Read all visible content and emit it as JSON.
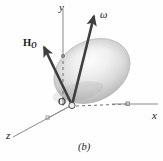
{
  "figure": {
    "caption": "(b)",
    "background_color": "#fefefe",
    "axes": [
      {
        "name": "y",
        "label": "y",
        "label_x": 59,
        "label_y": 2
      },
      {
        "name": "x",
        "label": "x",
        "label_x": 152,
        "label_y": 112
      },
      {
        "name": "z",
        "label": "z",
        "label_x": 6,
        "label_y": 131
      }
    ],
    "origin": {
      "label": "O",
      "label_x": 58,
      "label_y": 98,
      "point_x": 72,
      "point_y": 106
    },
    "vectors": [
      {
        "name": "angular-momentum-vector",
        "label": "H",
        "subscript": "O",
        "label_x": 23,
        "label_y": 38,
        "from_x": 72,
        "from_y": 105,
        "to_x": 44,
        "to_y": 47,
        "color": "#3f3f3f"
      },
      {
        "name": "angular-velocity-vector",
        "label": "ω",
        "label_x": 100,
        "label_y": 11,
        "from_x": 72,
        "from_y": 105,
        "to_x": 94,
        "to_y": 16,
        "color": "#3f3f3f"
      }
    ],
    "body": {
      "name": "rigid-body-ellipsoid",
      "fill_light": "#fbfbfb",
      "fill_mid": "#d2d2d2",
      "fill_dark": "#9a9a9a",
      "center_x": 92,
      "center_y": 71,
      "radius_x": 40,
      "radius_y": 30,
      "rotation_deg": -28
    },
    "colors": {
      "axis_line": "#8a8a8a",
      "dashed_line": "#6f6f6f",
      "vector": "#3f3f3f",
      "text": "#1a1a1a"
    }
  }
}
